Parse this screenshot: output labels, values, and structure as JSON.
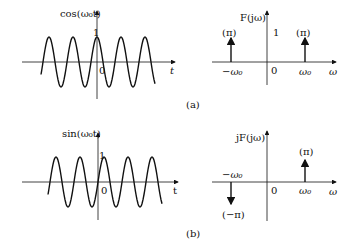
{
  "figure": {
    "panel_a": {
      "caption": "(a)",
      "time_plot": {
        "ylabel": "cos(ω₀t)",
        "xlabel": "t",
        "origin": "0",
        "peak_label": "1",
        "function": "cos"
      },
      "freq_plot": {
        "ylabel": "F(jω)",
        "xlabel": "ω",
        "origin": "0",
        "axis_tick": "1",
        "impulses": [
          {
            "position": "−ω₀",
            "weight": "(π)",
            "direction": "up"
          },
          {
            "position": "ω₀",
            "weight": "(π)",
            "direction": "up"
          }
        ]
      }
    },
    "panel_b": {
      "caption": "(b)",
      "time_plot": {
        "ylabel": "sin(ω₀t)",
        "xlabel": "t",
        "origin": "0",
        "peak_label": "1",
        "function": "sin"
      },
      "freq_plot": {
        "ylabel": "jF(jω)",
        "xlabel": "ω",
        "origin": "0",
        "impulses": [
          {
            "position": "−ω₀",
            "weight": "(−π)",
            "direction": "down"
          },
          {
            "position": "ω₀",
            "weight": "(π)",
            "direction": "up"
          }
        ]
      }
    }
  }
}
